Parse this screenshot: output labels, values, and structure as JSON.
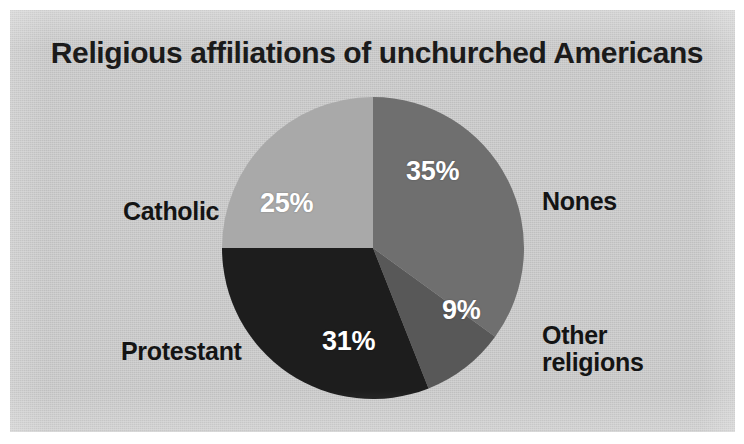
{
  "figure": {
    "title": "Religious affiliations of unchurched Americans",
    "background_color": "#c9c9c9",
    "page_color": "#ffffff",
    "title_color": "#1b1b1b"
  },
  "chart_data": {
    "type": "pie",
    "title": "Religious affiliations of unchurched Americans",
    "xlabel": "",
    "ylabel": "",
    "categories": [
      "Nones",
      "Other religions",
      "Protestant",
      "Catholic"
    ],
    "values": [
      35,
      9,
      31,
      25
    ],
    "value_labels": [
      "35%",
      "9%",
      "31%",
      "25%"
    ],
    "units": "percent",
    "total": 100,
    "start_angle_deg": 0,
    "direction": "clockwise",
    "legend": "none",
    "grid": false,
    "slice_label_placement": "outside",
    "value_label_placement": "inside",
    "slices": [
      {
        "name": "Nones",
        "value": 35,
        "value_label": "35%",
        "color": "#6f6f6f",
        "start_deg": 0,
        "end_deg": 126
      },
      {
        "name": "Other religions",
        "value": 9,
        "value_label": "9%",
        "color": "#585858",
        "start_deg": 126,
        "end_deg": 158.4
      },
      {
        "name": "Protestant",
        "value": 31,
        "value_label": "31%",
        "color": "#1d1d1d",
        "start_deg": 158.4,
        "end_deg": 270
      },
      {
        "name": "Catholic",
        "value": 25,
        "value_label": "25%",
        "color": "#a9a9a9",
        "start_deg": 270,
        "end_deg": 360
      }
    ]
  },
  "labels": {
    "nones": "Nones",
    "catholic": "Catholic",
    "protestant": "Protestant",
    "other_line1": "Other",
    "other_line2": "religions"
  },
  "values": {
    "nones": "35%",
    "catholic": "25%",
    "protestant": "31%",
    "other": "9%"
  }
}
